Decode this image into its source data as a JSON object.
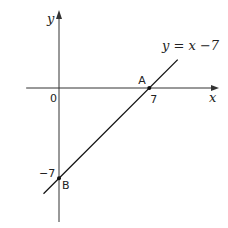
{
  "chart_data": {
    "type": "line",
    "title": "",
    "xlabel": "x",
    "ylabel": "y",
    "origin_label": "0",
    "xlim": [
      -2.7,
      10.5
    ],
    "ylim": [
      -10.7,
      5.8
    ],
    "grid": false,
    "series": [
      {
        "name": "y = x −7",
        "equation": "y = x - 7",
        "x": [
          -1.2,
          9.2
        ],
        "y": [
          -8.2,
          2.2
        ]
      }
    ],
    "points": [
      {
        "label": "A",
        "x": 7,
        "y": 0,
        "tick_label": "7"
      },
      {
        "label": "B",
        "x": 0,
        "y": -7,
        "tick_label": "−7"
      }
    ],
    "annotation": "y = x −7"
  }
}
